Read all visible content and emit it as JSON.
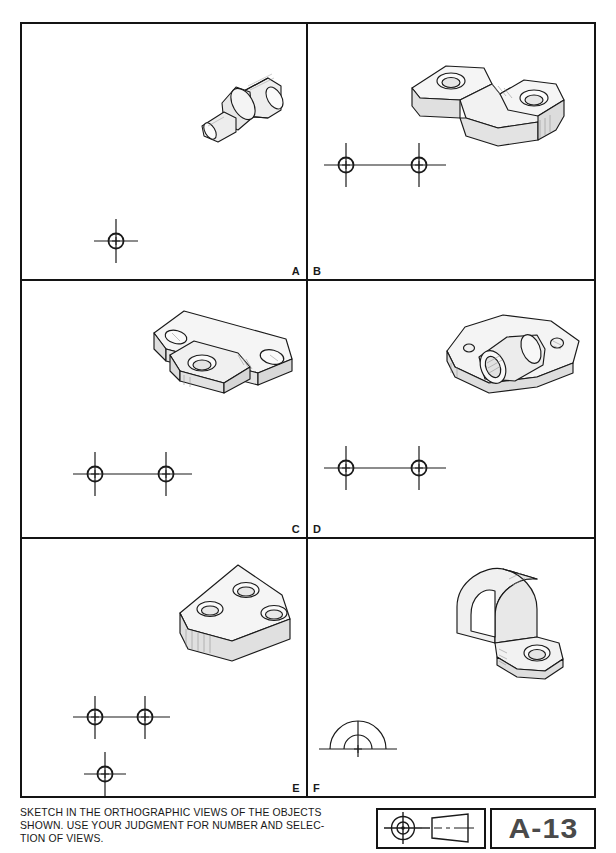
{
  "sheet": {
    "number": "A-13",
    "instructions": "SKETCH IN THE ORTHOGRAPHIC VIEWS OF THE OBJECTS\nSHOWN.  USE YOUR JUDGMENT FOR NUMBER AND SELEC-\nTION OF VIEWS.",
    "symbol_description": "front-view-circle-and-tapered-side-view-symbol",
    "ink_color": "#141414",
    "paper_color": "#ffffff"
  },
  "panels": [
    {
      "id": "a",
      "label": "A",
      "object_name": "stepped-cylindrical-shaft",
      "object_description": "Stepped round boss: large cylinder, collar flange, and small stub shaft, drawn in isometric pictorial.",
      "layout_marks": {
        "type": "crosshair-group",
        "count": 1,
        "connected": false,
        "description": "single center-line crosshair locating one view"
      }
    },
    {
      "id": "b",
      "label": "B",
      "object_name": "offset-link-bracket",
      "object_description": "Flat offset link with two counterbored holes and a stepped slot between the lobes.",
      "layout_marks": {
        "type": "crosshair-group",
        "count": 2,
        "connected": true,
        "description": "two crosshairs joined by a horizontal center line"
      }
    },
    {
      "id": "c",
      "label": "C",
      "object_name": "angled-three-hole-bracket",
      "object_description": "Angled bracket arm with two end holes and a projecting center boss with a through hole.",
      "layout_marks": {
        "type": "crosshair-group",
        "count": 2,
        "connected": true,
        "description": "two crosshairs joined by a horizontal center line"
      }
    },
    {
      "id": "d",
      "label": "D",
      "object_name": "flanged-bearing-bushing",
      "object_description": "Cylindrical bushing with an oval mounting flange and two bolt holes.",
      "layout_marks": {
        "type": "crosshair-group",
        "count": 2,
        "connected": true,
        "description": "two crosshairs joined by a horizontal center line"
      }
    },
    {
      "id": "e",
      "label": "E",
      "object_name": "triangular-three-hole-plate",
      "object_description": "Triangular plate with rounded corners and three drilled holes.",
      "layout_marks": {
        "type": "crosshair-group",
        "count": 3,
        "connected": true,
        "description": "two crosshairs joined by a horizontal center line plus a third crosshair below the left one"
      }
    },
    {
      "id": "f",
      "label": "F",
      "object_name": "saddle-strap-clamp",
      "object_description": "Formed saddle strap clamp with an arched web and a flat mounting ear with one hole.",
      "layout_marks": {
        "type": "semicircle-centerline",
        "count": 1,
        "connected": false,
        "description": "two concentric semicircular arcs on a base line with a vertical center line"
      }
    }
  ]
}
